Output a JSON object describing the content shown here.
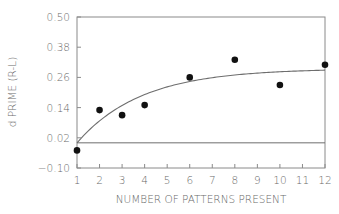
{
  "chart_data": {
    "type": "scatter",
    "title": "",
    "xlabel": "NUMBER OF PATTERNS PRESENT",
    "ylabel": "d PRIME (R-L)",
    "xlim": [
      1,
      12
    ],
    "ylim": [
      -0.1,
      0.5
    ],
    "x_ticks": [
      1,
      2,
      3,
      4,
      5,
      6,
      7,
      8,
      9,
      10,
      11,
      12
    ],
    "x_tick_labels": [
      "1",
      "2",
      "3",
      "4",
      "5",
      "6",
      "7",
      "8",
      "9",
      "10",
      "11",
      "12"
    ],
    "y_ticks": [
      -0.1,
      0.02,
      0.14,
      0.26,
      0.38,
      0.5
    ],
    "y_tick_labels": [
      "-0.10",
      "0.02",
      "0.14",
      "0.26",
      "0.38",
      "0.50"
    ],
    "grid": false,
    "legend": null,
    "series": [
      {
        "name": "observed d prime",
        "kind": "scatter",
        "x": [
          1,
          2,
          3,
          4,
          6,
          8,
          10,
          12
        ],
        "y": [
          -0.03,
          0.13,
          0.11,
          0.15,
          0.26,
          0.33,
          0.23,
          0.31
        ]
      },
      {
        "name": "fitted curve",
        "kind": "line",
        "model": "y = 0.295 * (1 - exp(-0.35 * (x - 1)))",
        "x": [
          1,
          2,
          3,
          4,
          5,
          6,
          7,
          8,
          9,
          10,
          11,
          12
        ],
        "y": [
          0.0,
          0.087,
          0.148,
          0.192,
          0.222,
          0.244,
          0.259,
          0.269,
          0.277,
          0.282,
          0.286,
          0.289
        ]
      },
      {
        "name": "chance reference line",
        "kind": "hline",
        "y": 0.0
      }
    ]
  }
}
